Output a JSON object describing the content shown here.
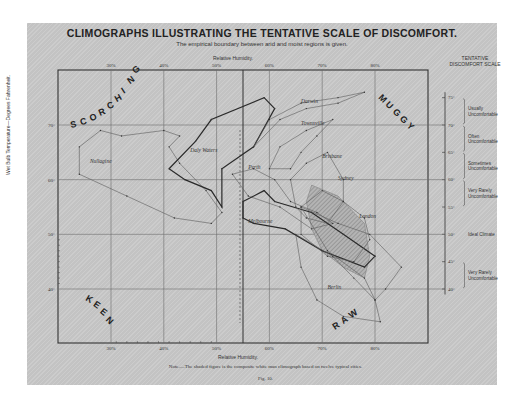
{
  "page": {
    "title": "CLIMOGRAPHS ILLUSTRATING THE TENTATIVE SCALE OF DISCOMFORT.",
    "subtitle": "The empirical boundary between arid and moist regions is given.",
    "note": "Note.—The shaded figure is the composite white man climograph based on twelve typical cities.",
    "figure": "Fig. 10.",
    "scale_header_line1": "TENTATIVE",
    "scale_header_line2": "DISCOMFORT SCALE"
  },
  "chart_data": {
    "type": "line",
    "title": "CLIMOGRAPHS ILLUSTRATING THE TENTATIVE SCALE OF DISCOMFORT.",
    "subtitle": "The empirical boundary between arid and moist regions is given.",
    "xlabel": "Relative Humidity.",
    "ylabel": "Wet Bulb Temperature—Degrees Fahrenheit.",
    "xlim": [
      20,
      90
    ],
    "ylim": [
      32,
      78
    ],
    "x_ticks": [
      "30%",
      "40%",
      "50%",
      "60%",
      "70%",
      "80%"
    ],
    "y_ticks": [
      "40°",
      "50°",
      "60°",
      "70°"
    ],
    "grid": true,
    "boundary_line": {
      "x": 55,
      "label": "Empirical boundary between arid and moist regions"
    },
    "regions": [
      {
        "label": "SCORCHING",
        "position": "top-left"
      },
      {
        "label": "MUGGY",
        "position": "top-right"
      },
      {
        "label": "KEEN",
        "position": "bottom-left"
      },
      {
        "label": "RAW",
        "position": "bottom-right"
      }
    ],
    "discomfort_scale": [
      {
        "range": "70°–75°",
        "label": "Usually Uncomfortable"
      },
      {
        "range": "65°–70°",
        "label": "Often Uncomfortable"
      },
      {
        "range": "60°–65°",
        "label": "Sometimes Uncomfortable"
      },
      {
        "range": "55°–60°",
        "label": "Very Rarely Uncomfortable"
      },
      {
        "range": "50°",
        "label": "Ideal Climate"
      },
      {
        "range": "40°–45°",
        "label": "Very Rarely Uncomfortable"
      }
    ],
    "scale_ticks": [
      "75°",
      "70°",
      "65°",
      "60°",
      "55°",
      "50°",
      "45°",
      "40°"
    ],
    "series": [
      {
        "name": "Nullagine",
        "weight": "light",
        "points": [
          [
            24,
            66
          ],
          [
            24,
            61
          ],
          [
            33,
            57
          ],
          [
            42,
            53
          ],
          [
            49,
            52
          ],
          [
            51,
            54
          ],
          [
            48,
            58
          ],
          [
            43,
            63
          ],
          [
            41,
            66
          ],
          [
            43,
            68
          ],
          [
            40,
            69
          ],
          [
            32,
            68
          ],
          [
            28,
            69
          ],
          [
            24,
            66
          ]
        ]
      },
      {
        "name": "Daly Waters",
        "weight": "heavy",
        "points": [
          [
            41,
            62
          ],
          [
            46,
            67
          ],
          [
            49,
            71
          ],
          [
            59,
            75
          ],
          [
            61,
            73
          ],
          [
            57,
            66
          ],
          [
            51,
            62
          ],
          [
            51,
            55
          ],
          [
            49,
            58
          ],
          [
            44,
            60
          ],
          [
            41,
            62
          ]
        ]
      },
      {
        "name": "Perth",
        "weight": "light",
        "points": [
          [
            53,
            61
          ],
          [
            57,
            62
          ],
          [
            61,
            60
          ],
          [
            64,
            56
          ],
          [
            69,
            54
          ],
          [
            72,
            52
          ],
          [
            68,
            51
          ],
          [
            62,
            55
          ],
          [
            56,
            57
          ],
          [
            53,
            61
          ]
        ]
      },
      {
        "name": "Melbourne",
        "weight": "heavy",
        "points": [
          [
            55,
            56
          ],
          [
            55,
            53
          ],
          [
            57,
            52
          ],
          [
            63,
            51
          ],
          [
            70,
            47
          ],
          [
            78,
            44
          ],
          [
            80,
            46
          ],
          [
            74,
            50
          ],
          [
            68,
            54
          ],
          [
            61,
            56
          ],
          [
            59,
            58
          ],
          [
            55,
            56
          ]
        ]
      },
      {
        "name": "Darwin",
        "weight": "light",
        "points": [
          [
            57,
            66
          ],
          [
            60,
            71
          ],
          [
            66,
            74
          ],
          [
            73,
            75
          ],
          [
            78,
            76
          ],
          [
            73,
            74
          ],
          [
            67,
            73
          ],
          [
            62,
            71
          ],
          [
            57,
            66
          ]
        ]
      },
      {
        "name": "Townsville",
        "weight": "light",
        "points": [
          [
            60,
            62
          ],
          [
            62,
            66
          ],
          [
            67,
            69
          ],
          [
            72,
            71
          ],
          [
            69,
            68
          ],
          [
            66,
            65
          ],
          [
            64,
            62
          ],
          [
            60,
            62
          ]
        ]
      },
      {
        "name": "Brisbane",
        "weight": "light",
        "points": [
          [
            65,
            55
          ],
          [
            64,
            60
          ],
          [
            67,
            63
          ],
          [
            71,
            65
          ],
          [
            74,
            60
          ],
          [
            74,
            56
          ],
          [
            71,
            52
          ],
          [
            67,
            53
          ],
          [
            65,
            55
          ]
        ]
      },
      {
        "name": "Sydney",
        "weight": "light",
        "points": [
          [
            66,
            50
          ],
          [
            66,
            55
          ],
          [
            70,
            58
          ],
          [
            74,
            56
          ],
          [
            78,
            53
          ],
          [
            79,
            49
          ],
          [
            76,
            45
          ],
          [
            71,
            46
          ],
          [
            66,
            50
          ]
        ]
      },
      {
        "name": "London",
        "weight": "light",
        "points": [
          [
            66,
            55
          ],
          [
            73,
            52
          ],
          [
            79,
            50
          ],
          [
            85,
            44
          ],
          [
            82,
            40
          ],
          [
            80,
            38
          ],
          [
            78,
            42
          ],
          [
            71,
            47
          ],
          [
            66,
            55
          ]
        ]
      },
      {
        "name": "Berlin",
        "weight": "light",
        "points": [
          [
            65,
            50
          ],
          [
            66,
            44
          ],
          [
            69,
            38
          ],
          [
            74,
            35
          ],
          [
            81,
            34
          ],
          [
            80,
            38
          ],
          [
            76,
            42
          ],
          [
            72,
            46
          ],
          [
            65,
            50
          ]
        ]
      }
    ],
    "composite_shaded": {
      "name": "Composite white man climograph (twelve typical cities)",
      "points": [
        [
          68,
          59
        ],
        [
          73,
          57
        ],
        [
          78,
          52
        ],
        [
          79,
          46
        ],
        [
          78,
          42
        ],
        [
          74,
          44
        ],
        [
          70,
          47
        ],
        [
          68,
          51
        ],
        [
          67,
          56
        ],
        [
          68,
          59
        ]
      ]
    },
    "series_labels": [
      {
        "name": "Nullagine",
        "x": 26,
        "y": 63
      },
      {
        "name": "Daly Waters",
        "x": 45,
        "y": 65
      },
      {
        "name": "Perth",
        "x": 56,
        "y": 62
      },
      {
        "name": "Melbourne",
        "x": 56,
        "y": 52
      },
      {
        "name": "Darwin",
        "x": 66,
        "y": 74
      },
      {
        "name": "Townsville",
        "x": 66,
        "y": 70
      },
      {
        "name": "Brisbane",
        "x": 70,
        "y": 64
      },
      {
        "name": "Sydney",
        "x": 73,
        "y": 60
      },
      {
        "name": "London",
        "x": 77,
        "y": 53
      },
      {
        "name": "Berlin",
        "x": 71,
        "y": 40
      }
    ]
  },
  "axes": {
    "top_label": "Relative Humidity.",
    "bottom_label": "Relative Humidity.",
    "left_label": "Wet Bulb Temperature—Degrees Fahrenheit."
  }
}
